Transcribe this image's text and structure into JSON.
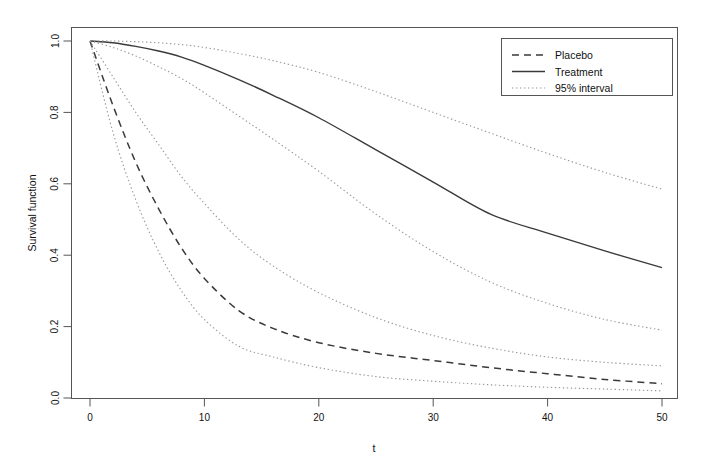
{
  "chart_data": {
    "type": "line",
    "title": "",
    "xlabel": "t",
    "ylabel": "Survival function",
    "xlim": [
      0,
      50
    ],
    "ylim": [
      0,
      1
    ],
    "grid": false,
    "legend_position": "top-right",
    "xticks": [
      "0",
      "10",
      "20",
      "30",
      "40",
      "50"
    ],
    "xtick_values": [
      0,
      10,
      20,
      30,
      40,
      50
    ],
    "yticks": [
      "0.0",
      "0.2",
      "0.4",
      "0.6",
      "0.8",
      "1.0"
    ],
    "ytick_values": [
      0.0,
      0.2,
      0.4,
      0.6,
      0.8,
      1.0
    ],
    "x": [
      0,
      2,
      4,
      6,
      8,
      10,
      13,
      16,
      20,
      25,
      30,
      35,
      40,
      45,
      50
    ],
    "series": [
      {
        "name": "Placebo",
        "style": "dashed",
        "color": "#3a3a3a",
        "values": [
          1.0,
          0.82,
          0.66,
          0.53,
          0.42,
          0.335,
          0.245,
          0.195,
          0.155,
          0.125,
          0.105,
          0.085,
          0.068,
          0.052,
          0.04
        ]
      },
      {
        "name": "Treatment",
        "style": "solid",
        "color": "#3a3a3a",
        "values": [
          1.0,
          0.995,
          0.985,
          0.972,
          0.955,
          0.932,
          0.892,
          0.848,
          0.785,
          0.695,
          0.605,
          0.515,
          0.462,
          0.412,
          0.365
        ]
      },
      {
        "name": "Placebo upper 95%",
        "style": "dotted",
        "color": "#9a9a9a",
        "values": [
          1.0,
          0.9,
          0.8,
          0.71,
          0.62,
          0.545,
          0.445,
          0.37,
          0.295,
          0.225,
          0.175,
          0.14,
          0.115,
          0.1,
          0.09
        ]
      },
      {
        "name": "Placebo lower 95%",
        "style": "dotted",
        "color": "#9a9a9a",
        "values": [
          1.0,
          0.745,
          0.555,
          0.41,
          0.3,
          0.22,
          0.145,
          0.115,
          0.085,
          0.06,
          0.047,
          0.037,
          0.03,
          0.025,
          0.02
        ]
      },
      {
        "name": "Treatment upper 95%",
        "style": "dotted",
        "color": "#9a9a9a",
        "values": [
          1.0,
          1.0,
          0.998,
          0.995,
          0.99,
          0.982,
          0.965,
          0.945,
          0.912,
          0.858,
          0.8,
          0.742,
          0.685,
          0.632,
          0.585
        ]
      },
      {
        "name": "Treatment lower 95%",
        "style": "dotted",
        "color": "#9a9a9a",
        "values": [
          1.0,
          0.982,
          0.958,
          0.928,
          0.895,
          0.855,
          0.79,
          0.725,
          0.635,
          0.515,
          0.41,
          0.325,
          0.265,
          0.22,
          0.19
        ]
      }
    ],
    "legend": [
      {
        "label": "Placebo",
        "style": "dashed",
        "color": "#3a3a3a"
      },
      {
        "label": "Treatment",
        "style": "solid",
        "color": "#3a3a3a"
      },
      {
        "label": "95% interval",
        "style": "dotted",
        "color": "#9a9a9a"
      }
    ]
  },
  "axes": {
    "x_title": "t",
    "y_title": "Survival function"
  },
  "colors": {
    "background": "#ffffff",
    "frame": "#555555",
    "main_curve": "#3a3a3a",
    "interval_curve": "#9a9a9a"
  }
}
